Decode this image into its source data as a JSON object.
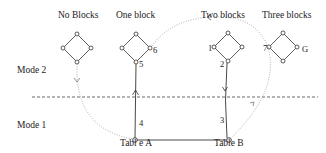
{
  "columns": [
    {
      "label": "No Blocks"
    },
    {
      "label": "One block"
    },
    {
      "label": "Two blocks"
    },
    {
      "label": "Three blocks"
    }
  ],
  "modes": [
    {
      "label": "Mode 2"
    },
    {
      "label": "Mode 1"
    }
  ],
  "tables": [
    {
      "label": "Tabl e A"
    },
    {
      "label": "Table B"
    }
  ],
  "node_labels": {
    "n1": "1",
    "n2": "2",
    "n3": "3",
    "n4": "4",
    "n5": "5",
    "n6": "6",
    "n7": "7",
    "goal": "G"
  },
  "colors": {
    "line": "#333333",
    "dotted": "#888888",
    "text": "#222222"
  }
}
